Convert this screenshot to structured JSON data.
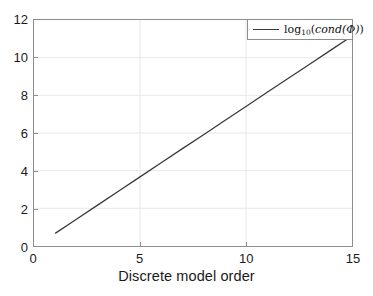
{
  "chart_data": {
    "type": "line",
    "title": "",
    "subtitle": "",
    "xlabel": "Discrete model order",
    "ylabel": "",
    "xlim": [
      0,
      15
    ],
    "ylim": [
      0,
      12
    ],
    "xticks": [
      0,
      5,
      10,
      15
    ],
    "xtick_labels": [
      "0",
      "5",
      "10",
      "15"
    ],
    "yticks": [
      0,
      2,
      4,
      6,
      8,
      10,
      12
    ],
    "ytick_labels": [
      "0",
      "2",
      "4",
      "6",
      "8",
      "10",
      "12"
    ],
    "grid": true,
    "legend_position": "upper right",
    "legend": [
      "log10(cond(Phi))"
    ],
    "series": [
      {
        "name": "log10(cond(Phi))",
        "color": "#3a3a3a",
        "x": [
          1,
          2,
          3,
          4,
          5,
          6,
          7,
          8,
          9,
          10,
          11,
          12,
          13,
          14,
          15
        ],
        "values": [
          0.67,
          1.42,
          2.17,
          2.92,
          3.67,
          4.42,
          5.17,
          5.91,
          6.66,
          7.41,
          8.16,
          8.91,
          9.65,
          10.4,
          11.15
        ]
      }
    ]
  },
  "legend": {
    "entry_label_prefix": "log",
    "entry_label_sub": "10",
    "entry_label_open": "(",
    "entry_label_func": "cond",
    "entry_label_arg": "(Φ)",
    "entry_label_close": ")"
  }
}
